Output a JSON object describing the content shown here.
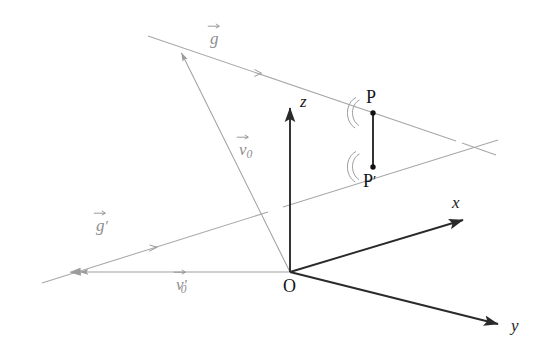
{
  "figure": {
    "background_color": "#ffffff",
    "dark_stroke_color": "#2a2a2a",
    "light_stroke_color": "#a8a8a8",
    "vector_label_color": "#8e8e8e",
    "point_color": "#111111"
  },
  "axes": {
    "origin_label": "O",
    "x_label": "x",
    "y_label": "y",
    "z_label": "z",
    "origin_point": {
      "x": 290,
      "y": 272
    },
    "x_tip": {
      "x": 466,
      "y": 219
    },
    "y_tip": {
      "x": 501,
      "y": 325
    },
    "z_tip": {
      "x": 290,
      "y": 105
    }
  },
  "points": [
    {
      "name": "P",
      "label": "P",
      "x": 373,
      "y": 113
    },
    {
      "name": "P-prime",
      "label": "P",
      "prime": "′",
      "x": 373,
      "y": 167
    }
  ],
  "vectors": [
    {
      "name": "g",
      "label": "g",
      "prime": "",
      "color": "#a0a0a0",
      "label_pos": {
        "x": 212,
        "y": 31
      },
      "line_from": {
        "x": 148,
        "y": 36
      },
      "line_to": {
        "x": 496,
        "y": 156
      },
      "tick_at": {
        "x": 258,
        "y": 73
      }
    },
    {
      "name": "g-prime",
      "label": "g",
      "prime": "′",
      "color": "#a0a0a0",
      "label_pos": {
        "x": 98,
        "y": 218
      },
      "line_from": {
        "x": 42,
        "y": 283
      },
      "line_to": {
        "x": 498,
        "y": 140
      },
      "tick_at": {
        "x": 155,
        "y": 247
      }
    },
    {
      "name": "v0",
      "label": "v",
      "sub": "0",
      "prime": "",
      "color": "#9a9a9a",
      "label_pos": {
        "x": 240,
        "y": 142
      },
      "line_from": {
        "x": 290,
        "y": 272
      },
      "line_to": {
        "x": 180,
        "y": 50
      }
    },
    {
      "name": "v0-prime",
      "label": "v",
      "sub": "0",
      "prime": "′",
      "color": "#9a9a9a",
      "label_pos": {
        "x": 176,
        "y": 277
      },
      "line_from": {
        "x": 290,
        "y": 272
      },
      "line_to": {
        "x": 75,
        "y": 272
      }
    }
  ],
  "segments": [
    {
      "name": "pp-prime-segment",
      "from": {
        "x": 373,
        "y": 113
      },
      "to": {
        "x": 373,
        "y": 167
      },
      "color": "#2a2a2a"
    }
  ],
  "angle_marks": [
    {
      "name": "right-angle-arc-at-p",
      "at": {
        "x": 373,
        "y": 113
      },
      "arcs": 2
    },
    {
      "name": "right-angle-arc-at-p-prime",
      "at": {
        "x": 373,
        "y": 167
      },
      "arcs": 2
    }
  ]
}
